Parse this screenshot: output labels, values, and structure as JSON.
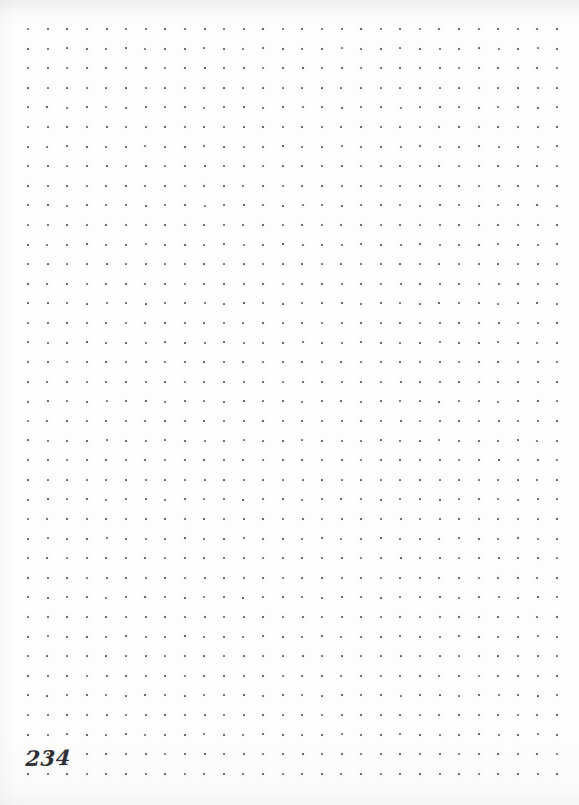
{
  "page": {
    "width": 579,
    "height": 805,
    "type": "dot-grid-notebook-page",
    "content_state": "blank",
    "paper_color": "#fdfdfd",
    "page_number": "234"
  },
  "grid": {
    "dot_color": "#5a5a62",
    "dot_size_px": 2,
    "spacing_px": 19.6,
    "origin_x": 27,
    "origin_y": 28,
    "columns": 28,
    "rows": 39,
    "last_column_x": 556,
    "last_row_y": 776
  },
  "artifacts": {
    "top_shadow": "faint gray scan shadow",
    "bottom_shadow": "faint gray scan smudge",
    "left_shadow": "faint gray edge tint"
  }
}
